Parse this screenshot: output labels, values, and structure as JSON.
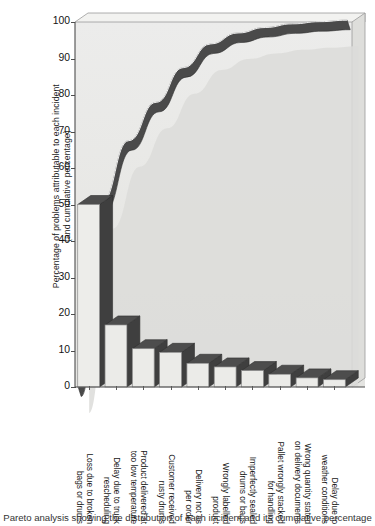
{
  "chart_data": {
    "type": "bar",
    "title": "",
    "xlabel": "",
    "ylabel": "Percentage of problems attributable to each incident (and cumulative percentage)",
    "ylabel_line1": "Percentage of problems attributable to each incident",
    "ylabel_line2": "(and cumulative percentage)",
    "ylim": [
      0,
      100
    ],
    "yticks": [
      0,
      10,
      20,
      30,
      40,
      50,
      60,
      70,
      80,
      90,
      100
    ],
    "grid": false,
    "legend": "none",
    "categories": [
      "Loss due to broken bags or drums",
      "Delay due to truck rescheduling",
      "Product delivered at too low temperature",
      "Customer received rusty drums",
      "Delivery not as per order",
      "Wrongly labelled product",
      "Imperfectly sealed drums or bags",
      "Pallet wrongly stacked for handling",
      "Wrong quantity stated on delivery documents",
      "Delay due to weather conditions"
    ],
    "category_lines": [
      [
        "Loss due to broken",
        "bags or drums"
      ],
      [
        "Delay due to truck",
        "rescheduling"
      ],
      [
        "Product delivered at",
        "too low temperature"
      ],
      [
        "Customer received",
        "rusty drums"
      ],
      [
        "Delivery not as",
        "per order"
      ],
      [
        "Wrongly labelled",
        "product"
      ],
      [
        "Imperfectly sealed",
        "drums or bags"
      ],
      [
        "Pallet wrongly stacked",
        "for handling"
      ],
      [
        "Wrong quantity stated",
        "on delivery documents"
      ],
      [
        "Delay due to",
        "weather conditions"
      ]
    ],
    "values": [
      50,
      17,
      10.5,
      9.5,
      6.5,
      5.5,
      4.5,
      3.5,
      2.5,
      2
    ],
    "cumulative": [
      50,
      67,
      77.5,
      87,
      93.5,
      99,
      103.5,
      107,
      109.5,
      111.5
    ],
    "cumulative_normalised": [
      50,
      67,
      77.5,
      87,
      93.5,
      96.5,
      98,
      99,
      99.6,
      100
    ],
    "series": [
      {
        "name": "Percentage per incident",
        "values": [
          50,
          17,
          10.5,
          9.5,
          6.5,
          5.5,
          4.5,
          3.5,
          2.5,
          2
        ]
      },
      {
        "name": "Cumulative percentage",
        "values": [
          50,
          67,
          77.5,
          87,
          93.5,
          96.5,
          98,
          99,
          99.6,
          100
        ]
      }
    ]
  },
  "colors": {
    "bar_front": "#ebebe8",
    "bar_top": "#4d4d4d",
    "bar_side": "#3f3f3f",
    "plot_background": "#e9e9e6",
    "curve_band": "#4a4a4a",
    "curve_band_light": "#d3d3d0",
    "axis": "#4d4d4d",
    "text": "#1a1a1a"
  },
  "caption": {
    "text": "Pareto analysis showing the distribution of each incident and its cumulative percentage"
  }
}
